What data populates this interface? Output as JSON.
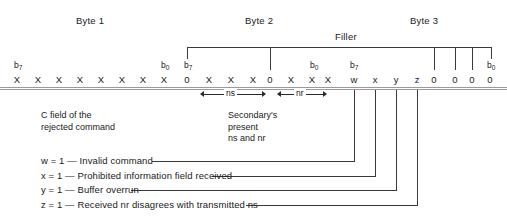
{
  "headers": {
    "byte1": "Byte 1",
    "byte2": "Byte 2",
    "byte3": "Byte 3",
    "filler": "Filler"
  },
  "bit_names": {
    "msb": "b7",
    "lsb": "b0"
  },
  "bytes": [
    {
      "name": "Byte 1",
      "msb_label": "b7",
      "lsb_label": "b0",
      "bits": [
        "X",
        "X",
        "X",
        "X",
        "X",
        "X",
        "X",
        "X"
      ]
    },
    {
      "name": "Byte 2",
      "msb_label": "b7",
      "lsb_label": "b0",
      "bits": [
        "0",
        "X",
        "X",
        "X",
        "0",
        "X",
        "X",
        "X"
      ]
    },
    {
      "name": "Byte 3",
      "msb_label": "b7",
      "lsb_label": "b0",
      "bits": [
        "w",
        "x",
        "y",
        "z",
        "0",
        "0",
        "0",
        "0"
      ]
    }
  ],
  "subfield_arrows": [
    {
      "label": "ns"
    },
    {
      "label": "nr"
    }
  ],
  "captions": {
    "left": {
      "line1": "C field of the",
      "line2": "rejected command"
    },
    "middle": {
      "line1": "Secondary's",
      "line2": "present",
      "line3": "ns and nr"
    }
  },
  "legend": [
    {
      "symbol": "w",
      "text": "w = 1 — Invalid command"
    },
    {
      "symbol": "x",
      "text": "x = 1 — Prohibited information field received"
    },
    {
      "symbol": "y",
      "text": "y = 1 — Buffer overrun"
    },
    {
      "symbol": "z",
      "text": "z = 1 — Received nr disagrees with transmitted ns"
    }
  ],
  "colors": {
    "ink": "#1a1a1a",
    "line": "#3a3a3a",
    "rule": "#9a9a9a",
    "background": "#ffffff"
  }
}
